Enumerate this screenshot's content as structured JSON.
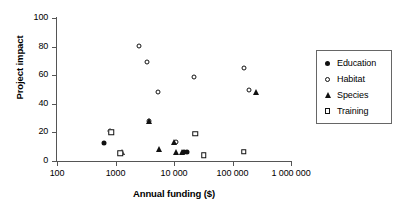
{
  "chart_data": {
    "type": "scatter",
    "title": "",
    "xlabel": "Annual funding ($)",
    "ylabel": "Project impact",
    "xscale": "log",
    "xlim": [
      100,
      1000000
    ],
    "ylim": [
      0,
      100
    ],
    "xticks": [
      "100",
      "1000",
      "10000",
      "100000",
      "1000000"
    ],
    "xtick_values": [
      100,
      1000,
      10000,
      100000,
      1000000
    ],
    "xtick_labels_display": [
      "100",
      "1000",
      "10 000",
      "100 000",
      "1 000 000"
    ],
    "yticks": [
      "0",
      "20",
      "40",
      "60",
      "80",
      "100"
    ],
    "ytick_values": [
      0,
      20,
      40,
      60,
      80,
      100
    ],
    "grid": false,
    "legend_position": "right",
    "series": [
      {
        "name": "Education",
        "marker": "filled-circle",
        "color": "#111111",
        "points": [
          {
            "x": 630,
            "y": 12.5
          },
          {
            "x": 15000,
            "y": 6.5
          },
          {
            "x": 16500,
            "y": 6.5
          }
        ]
      },
      {
        "name": "Habitat",
        "marker": "open-circle",
        "color": "#111111",
        "points": [
          {
            "x": 820,
            "y": 21
          },
          {
            "x": 2500,
            "y": 80.5
          },
          {
            "x": 3400,
            "y": 69.5
          },
          {
            "x": 5400,
            "y": 48
          },
          {
            "x": 3800,
            "y": 28
          },
          {
            "x": 11000,
            "y": 13
          },
          {
            "x": 22000,
            "y": 59
          },
          {
            "x": 160000,
            "y": 65
          },
          {
            "x": 190000,
            "y": 50
          }
        ]
      },
      {
        "name": "Species",
        "marker": "filled-triangle",
        "color": "#111111",
        "points": [
          {
            "x": 1300,
            "y": 6
          },
          {
            "x": 3800,
            "y": 28
          },
          {
            "x": 5500,
            "y": 8.5
          },
          {
            "x": 10000,
            "y": 13.5
          },
          {
            "x": 11000,
            "y": 6.5
          },
          {
            "x": 13500,
            "y": 6.5
          },
          {
            "x": 250000,
            "y": 48
          }
        ]
      },
      {
        "name": "Training",
        "marker": "open-square",
        "color": "#111111",
        "points": [
          {
            "x": 850,
            "y": 20
          },
          {
            "x": 1200,
            "y": 5.5
          },
          {
            "x": 23000,
            "y": 19
          },
          {
            "x": 32000,
            "y": 4
          },
          {
            "x": 155000,
            "y": 6.5
          }
        ]
      }
    ]
  },
  "legend": {
    "items": [
      {
        "label": "Education",
        "marker": "filled-circle"
      },
      {
        "label": "Habitat",
        "marker": "open-circle"
      },
      {
        "label": "Species",
        "marker": "filled-triangle"
      },
      {
        "label": "Training",
        "marker": "open-square"
      }
    ]
  }
}
